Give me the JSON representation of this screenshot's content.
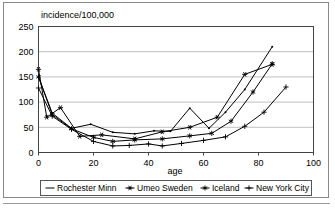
{
  "figure": {
    "frame_color": "#8a8a8a",
    "background": "#ffffff"
  },
  "chart_data": {
    "type": "line",
    "title": "",
    "subtitle": "",
    "xlabel": "age",
    "ylabel": "incidence/100,000",
    "ylabel_position": "top-left-above-axis",
    "xlim": [
      0,
      100
    ],
    "ylim": [
      0,
      250
    ],
    "xticks": [
      "0",
      "20",
      "40",
      "60",
      "80",
      "100"
    ],
    "yticks": [
      "0",
      "50",
      "100",
      "150",
      "200",
      "250"
    ],
    "grid": "horizontal",
    "grid_color": "#b0b0b0",
    "legend_position": "bottom",
    "line_color": "#000000",
    "series": [
      {
        "name": "Rochester Minn",
        "marker": "none",
        "marker_glyph": "—",
        "x": [
          0,
          5,
          12,
          19,
          27,
          35,
          42,
          48,
          55,
          62,
          68,
          75,
          85
        ],
        "y": [
          150,
          78,
          48,
          56,
          40,
          37,
          43,
          42,
          88,
          48,
          80,
          125,
          210
        ]
      },
      {
        "name": "Umeo Sweden",
        "marker": "star",
        "marker_glyph": "✳",
        "x": [
          0,
          3,
          8,
          15,
          23,
          35,
          45,
          55,
          65,
          75,
          85
        ],
        "y": [
          165,
          70,
          89,
          32,
          35,
          27,
          41,
          50,
          70,
          155,
          175
        ]
      },
      {
        "name": "Iceland",
        "marker": "asterisk",
        "marker_glyph": "∗",
        "x": [
          0,
          5,
          12,
          20,
          27,
          35,
          45,
          55,
          63,
          70,
          78,
          85
        ],
        "y": [
          150,
          75,
          47,
          30,
          22,
          25,
          27,
          33,
          38,
          62,
          120,
          176
        ]
      },
      {
        "name": "New York City",
        "marker": "plus",
        "marker_glyph": "—",
        "x": [
          0,
          5,
          12,
          20,
          27,
          33,
          40,
          45,
          52,
          60,
          68,
          75,
          82,
          90
        ],
        "y": [
          128,
          72,
          46,
          22,
          13,
          14,
          17,
          13,
          18,
          24,
          31,
          52,
          80,
          130
        ]
      }
    ]
  }
}
